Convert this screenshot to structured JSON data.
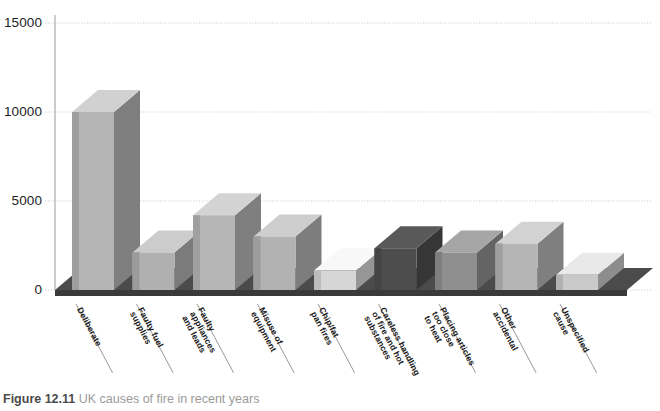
{
  "caption": {
    "figure_number": "Figure 12.11",
    "text": "UK causes of fire in recent years"
  },
  "chart_data": {
    "type": "bar",
    "title": "UK causes of fire in recent years",
    "xlabel": "",
    "ylabel": "",
    "ylim": [
      0,
      15000
    ],
    "yticks": [
      0,
      5000,
      10000,
      15000
    ],
    "ytick_labels": [
      "0",
      "5000",
      "10000",
      "15000"
    ],
    "grid": true,
    "legend": "none",
    "style": "3d-bar",
    "categories": [
      "Deliberate",
      "Faulty fuel supplies",
      "Faulty appliances and leads",
      "Misuse of equipment",
      "Chip/fat pan fires",
      "Careless handling of fire and hot substances",
      "Placing articles too close to heat",
      "Other accidental",
      "Unspecified cause"
    ],
    "category_lines": [
      [
        "Deliberate"
      ],
      [
        "Faulty fuel",
        "supplies"
      ],
      [
        "Faulty",
        "appliances",
        "and leads"
      ],
      [
        "Misuse of",
        "equipment"
      ],
      [
        "Chip/fat",
        "pan fires"
      ],
      [
        "Careless handling",
        "of fire and hot",
        "substances"
      ],
      [
        "Placing articles",
        "too close",
        "to heat"
      ],
      [
        "Other",
        "accidental"
      ],
      [
        "Unspecified",
        "cause"
      ]
    ],
    "values": [
      10000,
      2100,
      4200,
      3000,
      1100,
      2350,
      2100,
      2600,
      850
    ],
    "bar_colors": [
      "#b4b4b4",
      "#b0b0b0",
      "#b6b6b6",
      "#b2b2b2",
      "#d6d6d6",
      "#4d4d4d",
      "#8f8f8f",
      "#b5b5b5",
      "#c9c9c9"
    ]
  },
  "colors": {
    "floor": "#4b4b4b",
    "floor_dark": "#3a3a3a",
    "gridline": "#cfcfcf",
    "axis": "#9a9a9a",
    "caption_bold": "#4a4a4a",
    "caption_text": "#9b9b9b"
  }
}
